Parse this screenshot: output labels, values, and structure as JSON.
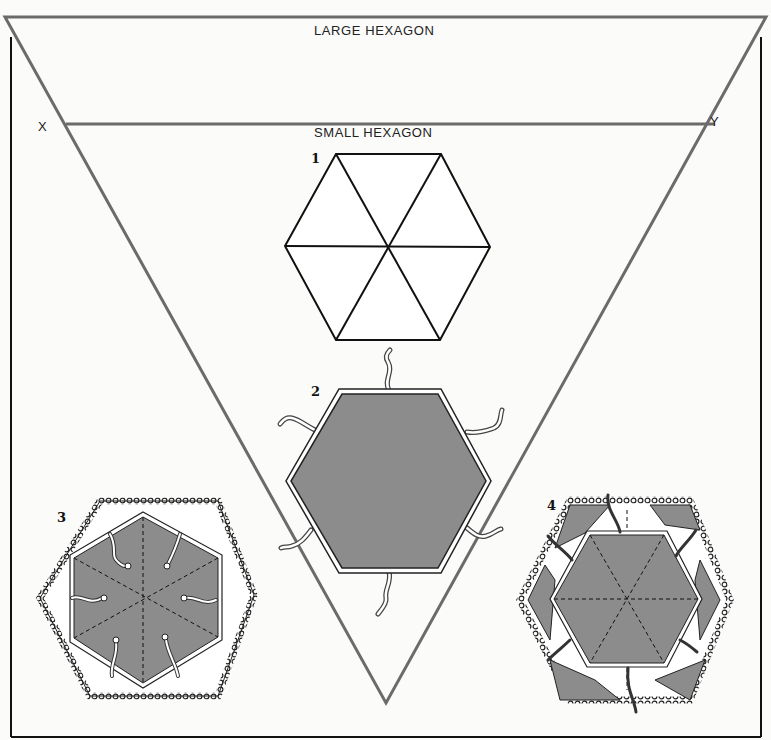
{
  "diagram": {
    "labels": {
      "large_hexagon": "LARGE HEXAGON",
      "small_hexagon": "SMALL HEXAGON",
      "point_x": "X",
      "point_y": "Y"
    },
    "steps": [
      {
        "number": "1",
        "description": "plain hexagon divided into six triangles"
      },
      {
        "number": "2",
        "description": "shaded hexagon with bound edge and six ties"
      },
      {
        "number": "3",
        "description": "shaded hexagon with dashed folds inside lace-edged large hexagon"
      },
      {
        "number": "4",
        "description": "assembled piece with flowered corner panels and lace edging"
      }
    ],
    "colors": {
      "triangle_guide": "#6b6b6b",
      "frame": "#111111",
      "fill_gray": "#8a8a8a",
      "background": "#fbfbfa"
    }
  }
}
